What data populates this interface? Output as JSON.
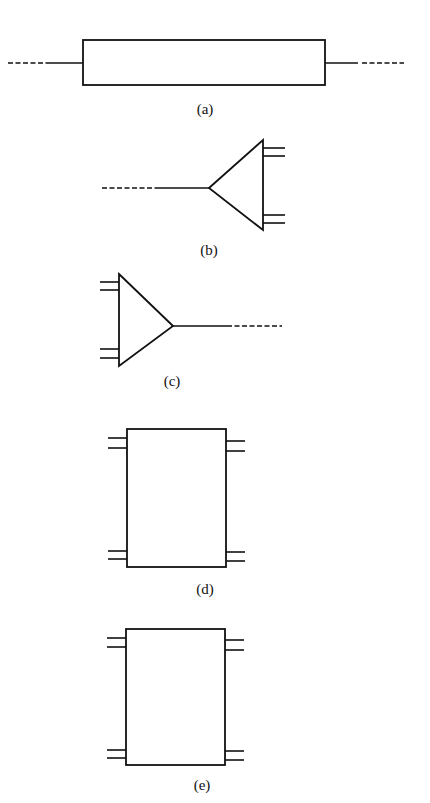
{
  "figure": {
    "panels": [
      {
        "id": "a",
        "label": "(a)",
        "shape": "rectangle-two-port",
        "description": "Horizontal rectangle with single lines extending left and right, ending in dashes"
      },
      {
        "id": "b",
        "label": "(b)",
        "shape": "triangle-pointing-left",
        "description": "Triangle with apex left connected to a line ending in dashes; two double-line terminals on right"
      },
      {
        "id": "c",
        "label": "(c)",
        "shape": "triangle-pointing-right",
        "description": "Triangle with apex right connected to a line ending in dashes; two double-line terminals on left"
      },
      {
        "id": "d",
        "label": "(d)",
        "shape": "rectangle-four-port",
        "description": "Vertical rectangle with double-line terminals at four corners"
      },
      {
        "id": "e",
        "label": "(e)",
        "shape": "rectangle-four-port",
        "description": "Vertical rectangle with double-line terminals at four corners"
      }
    ]
  }
}
